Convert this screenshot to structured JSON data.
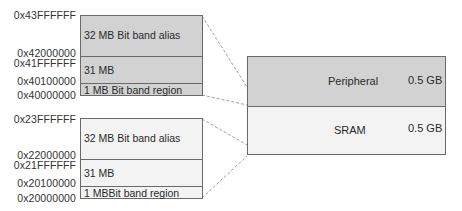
{
  "peripheral_block": {
    "addresses": {
      "top": "0x43FFFFFF",
      "alias_start": "0x42000000",
      "mid_end": "0x41FFFFFF",
      "mid_start": "0x40100000",
      "start": "0x40000000"
    },
    "segments": [
      {
        "label": "32 MB Bit band alias"
      },
      {
        "label": "31 MB"
      },
      {
        "label": "1 MB Bit band region"
      }
    ]
  },
  "sram_block": {
    "addresses": {
      "top": "0x23FFFFFF",
      "alias_start": "0x22000000",
      "mid_end": "0x21FFFFFF",
      "mid_start": "0x20100000",
      "start": "0x20000000"
    },
    "segments": [
      {
        "label": "32 MB Bit band alias"
      },
      {
        "label": "31 MB"
      },
      {
        "label": "1 MBBit band region"
      }
    ]
  },
  "memory_map": {
    "regions": [
      {
        "name": "Peripheral",
        "size": "0.5 GB"
      },
      {
        "name": "SRAM",
        "size": "0.5 GB"
      }
    ]
  },
  "colors": {
    "peripheral_fill": "#d2d2d2",
    "sram_fill": "#f3f3f3",
    "border": "#6a6a6a"
  }
}
